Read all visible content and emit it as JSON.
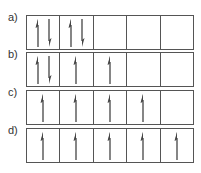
{
  "diagram": {
    "type": "orbital-box-diagram",
    "rows": [
      {
        "label": "a)",
        "boxes": [
          [
            "up",
            "down"
          ],
          [
            "up",
            "down"
          ],
          [],
          [],
          []
        ]
      },
      {
        "label": "b)",
        "boxes": [
          [
            "up",
            "down"
          ],
          [
            "up"
          ],
          [
            "up"
          ],
          [],
          []
        ]
      },
      {
        "label": "c)",
        "boxes": [
          [
            "up"
          ],
          [
            "up"
          ],
          [
            "up"
          ],
          [
            "up"
          ],
          []
        ]
      },
      {
        "label": "d)",
        "boxes": [
          [
            "up"
          ],
          [
            "up"
          ],
          [
            "up"
          ],
          [
            "up"
          ],
          [
            "up"
          ]
        ]
      }
    ],
    "colors": {
      "border": "#555555",
      "arrow": "#444444",
      "label": "#333333"
    }
  }
}
